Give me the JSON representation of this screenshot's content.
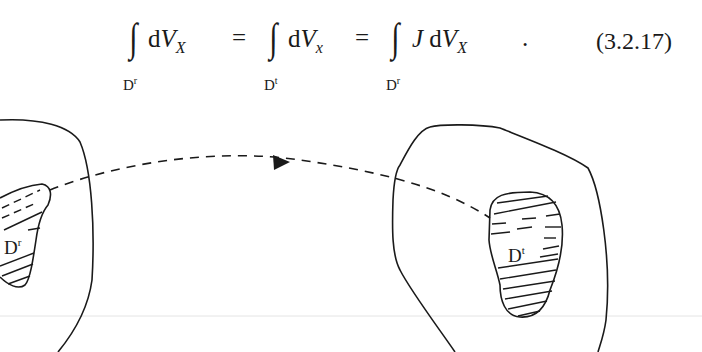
{
  "equation": {
    "integral_symbol": "∫",
    "terms": [
      {
        "limit_base": "D",
        "limit_sup": "r",
        "integrand_prefix": "",
        "d": "d",
        "var": "V",
        "sub": "X"
      },
      {
        "limit_base": "D",
        "limit_sup": "t",
        "integrand_prefix": "",
        "d": "d",
        "var": "V",
        "sub": "x"
      },
      {
        "limit_base": "D",
        "limit_sup": "r",
        "integrand_prefix": "J",
        "d": "d",
        "var": "V",
        "sub": "X"
      }
    ],
    "equals": "=",
    "terminator": ".",
    "number": "(3.2.17)"
  },
  "figure": {
    "reference_region_label": {
      "base": "D",
      "sup": "r"
    },
    "current_region_label": {
      "base": "D",
      "sup": "t"
    },
    "arrow_style": "dashed",
    "line_color": "#1a1a1a",
    "separator_color": "#e4e4e4"
  }
}
